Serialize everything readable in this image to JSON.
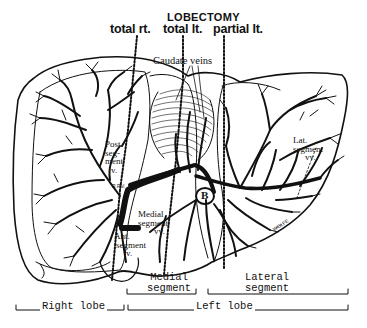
{
  "diagram": {
    "title": "LOBECTOMY",
    "procedures": [
      {
        "label": "total rt."
      },
      {
        "label": "total lt."
      },
      {
        "label": "partial lt."
      }
    ],
    "annotations": {
      "caudate_veins": "Caudate veins",
      "post_segment": [
        "Post.",
        "seg-",
        "ment",
        "v."
      ],
      "rpv": "R.P.V.",
      "lpv": "L.P.V.",
      "medial_segment_vv": [
        "Medial",
        "segment",
        "vv."
      ],
      "ant_segment_v": [
        "Ant.",
        "segment",
        "v."
      ],
      "b_marker": "B",
      "lat_segment_vv": [
        "Lat.",
        "segment",
        "vv."
      ],
      "artist_signature": "WOLFE"
    },
    "brackets": {
      "medial_segment": [
        "Medial",
        "segment"
      ],
      "lateral_segment": [
        "Lateral",
        "segment"
      ],
      "right_lobe": "Right lobe",
      "left_lobe": "Left lobe"
    },
    "colors": {
      "ink": "#111111",
      "background": "#ffffff"
    }
  }
}
